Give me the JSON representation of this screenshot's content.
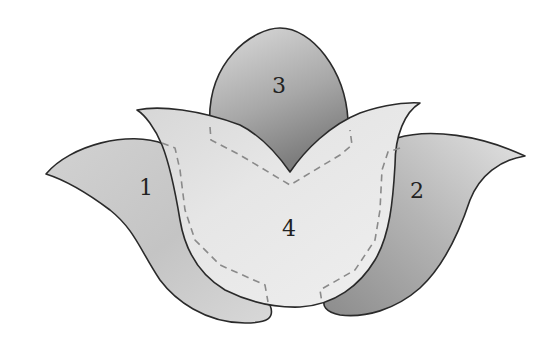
{
  "diagram": {
    "type": "applique-pattern",
    "pieces": [
      {
        "id": "1",
        "label": "1",
        "name": "left-petal"
      },
      {
        "id": "2",
        "label": "2",
        "name": "right-petal"
      },
      {
        "id": "3",
        "label": "3",
        "name": "top-petal"
      },
      {
        "id": "4",
        "label": "4",
        "name": "front-center-petal"
      }
    ],
    "colors": {
      "background": "#ffffff",
      "outline": "#2a2a2a",
      "stitch_line": "#8a8a8a",
      "piece_dark": "#8e8e8e",
      "piece_light": "#e6e6e6",
      "front_piece": "#ebebeb"
    }
  }
}
